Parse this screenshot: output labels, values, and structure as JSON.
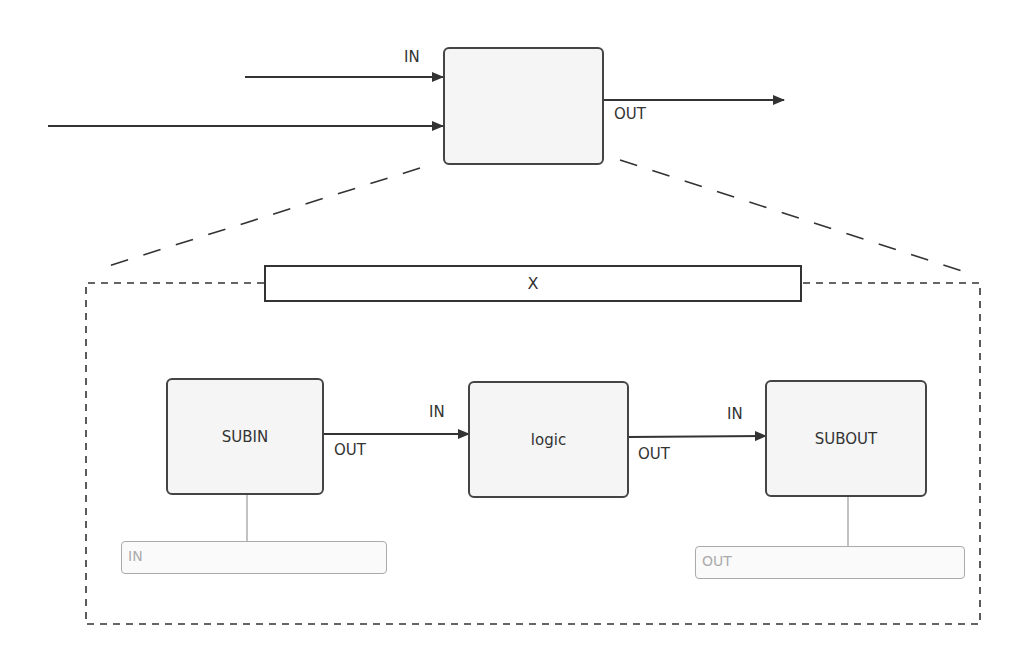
{
  "top_block": {
    "label": "",
    "in_port": "IN",
    "out_port": "OUT"
  },
  "subsystem": {
    "title": "X",
    "blocks": [
      {
        "name": "SUBIN",
        "in_label": "",
        "out_label": "OUT"
      },
      {
        "name": "logic",
        "in_label": "IN",
        "out_label": "OUT"
      },
      {
        "name": "SUBOUT",
        "in_label": "IN",
        "out_label": ""
      }
    ],
    "ports": [
      {
        "label": "IN"
      },
      {
        "label": "OUT"
      }
    ]
  },
  "colors": {
    "line": "#333333",
    "block_fill": "#f5f5f5",
    "port_border": "#aaaaaa"
  }
}
